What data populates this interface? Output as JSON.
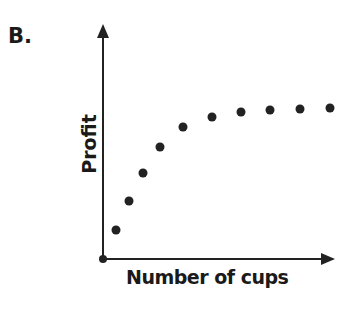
{
  "panel_label": "B.",
  "chart_data": {
    "type": "scatter",
    "title": "",
    "xlabel": "Number of cups",
    "ylabel": "Profit",
    "grid": false,
    "legend": null,
    "axis_ticks": "none",
    "x": [
      1,
      2,
      3,
      4,
      5,
      6,
      7,
      8,
      9,
      10
    ],
    "y": [
      1.0,
      2.0,
      3.0,
      3.9,
      4.5,
      4.85,
      5.0,
      5.07,
      5.1,
      5.13
    ],
    "shape": "increasing, concave, leveling off (diminishing returns)",
    "color": "#222222"
  },
  "plot_px": {
    "points": [
      [
        116,
        230
      ],
      [
        129,
        201
      ],
      [
        143,
        173
      ],
      [
        160,
        147
      ],
      [
        183,
        127
      ],
      [
        212,
        117
      ],
      [
        241,
        112
      ],
      [
        270,
        110
      ],
      [
        300,
        109
      ],
      [
        330,
        108
      ]
    ]
  }
}
